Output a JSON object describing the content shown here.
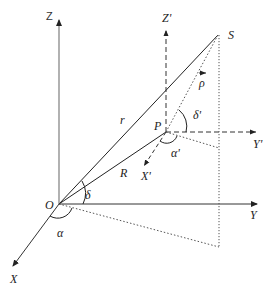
{
  "diagram": {
    "type": "3d-coordinate-geometry",
    "colors": {
      "axis": "#888888",
      "line": "#222222",
      "dashed": "#333333",
      "dotted": "#555555"
    },
    "labels": {
      "Z": "Z",
      "Y": "Y",
      "X": "X",
      "O": "O",
      "S": "S",
      "P": "P",
      "Zp": "Z'",
      "Yp": "Y'",
      "Xp": "X'",
      "r": "r",
      "R": "R",
      "rho": "ρ",
      "delta": "δ",
      "alpha": "α",
      "delta_p": "δ'",
      "alpha_p": "α'"
    },
    "points": {
      "O": [
        59,
        204
      ],
      "S": [
        218,
        35
      ],
      "P": [
        166,
        132
      ],
      "S_proj_ground": [
        219,
        247
      ],
      "S_proj_P_plane": [
        219,
        148
      ]
    }
  }
}
